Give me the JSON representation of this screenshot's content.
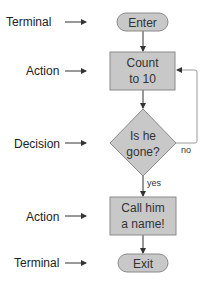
{
  "diagram": {
    "type": "flowchart",
    "colors": {
      "shape_fill": "#c8c8c8",
      "shape_stroke": "#8a8a8a",
      "arrow": "#333333",
      "loop_line": "#9a9a9a"
    },
    "legend_labels": [
      {
        "text": "Terminal",
        "y": 22
      },
      {
        "text": "Action",
        "y": 71
      },
      {
        "text": "Decision",
        "y": 143
      },
      {
        "text": "Action",
        "y": 216
      },
      {
        "text": "Terminal",
        "y": 263
      }
    ],
    "nodes": [
      {
        "id": "enter",
        "kind": "terminal",
        "lines": [
          "Enter"
        ]
      },
      {
        "id": "count",
        "kind": "action",
        "lines": [
          "Count",
          "to 10"
        ]
      },
      {
        "id": "gone",
        "kind": "decision",
        "lines": [
          "Is he",
          "gone?"
        ]
      },
      {
        "id": "call",
        "kind": "action",
        "lines": [
          "Call him",
          "a name!"
        ]
      },
      {
        "id": "exit",
        "kind": "terminal",
        "lines": [
          "Exit"
        ]
      }
    ],
    "edges": [
      {
        "from": "enter",
        "to": "count",
        "label": ""
      },
      {
        "from": "count",
        "to": "gone",
        "label": ""
      },
      {
        "from": "gone",
        "to": "count",
        "label": "no"
      },
      {
        "from": "gone",
        "to": "call",
        "label": "yes"
      },
      {
        "from": "call",
        "to": "exit",
        "label": ""
      }
    ]
  }
}
